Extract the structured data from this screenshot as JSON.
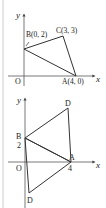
{
  "colors": {
    "line": "#333333",
    "axis": "#555555",
    "border": "#cccccc",
    "background": "#ffffff"
  },
  "diagram1": {
    "axis_x_label": "x",
    "axis_y_label": "y",
    "origin_label": "O",
    "points": {
      "A": "A(4, 0)",
      "B": "B(0, 2)",
      "C": "C(3, 3)"
    }
  },
  "diagram2": {
    "axis_x_label": "x",
    "axis_y_label": "y",
    "origin_label": "O",
    "points": {
      "A": "A",
      "B": "B",
      "D_top": "D",
      "D_bottom": "D"
    },
    "tick_labels": {
      "y_2": "2",
      "x_4": "4"
    }
  }
}
